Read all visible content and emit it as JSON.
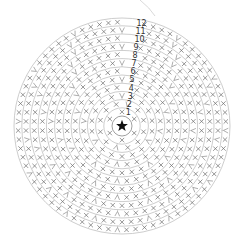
{
  "diagram": {
    "type": "crochet-round-chart",
    "center": {
      "x": 122,
      "y": 126,
      "radius": 10,
      "symbol": "star-icon",
      "meaning": "magic ring"
    },
    "outer_radius": 108,
    "round_spacing": 8.2,
    "rounds": [
      {
        "number": "1",
        "stitches": 6
      },
      {
        "number": "2",
        "stitches": 12
      },
      {
        "number": "3",
        "stitches": 18
      },
      {
        "number": "4",
        "stitches": 24
      },
      {
        "number": "5",
        "stitches": 30
      },
      {
        "number": "6",
        "stitches": 36
      },
      {
        "number": "7",
        "stitches": 42
      },
      {
        "number": "8",
        "stitches": 48
      },
      {
        "number": "9",
        "stitches": 54
      },
      {
        "number": "10",
        "stitches": 60
      },
      {
        "number": "11",
        "stitches": 66
      },
      {
        "number": "12",
        "stitches": 72
      }
    ],
    "stitch_symbol": "x",
    "increase_symbol": "v",
    "colors": {
      "ring": "#b8b8b8",
      "stitch": "#6a6a6a",
      "label": "#333333",
      "star": "#111111",
      "background": "#ffffff"
    }
  }
}
